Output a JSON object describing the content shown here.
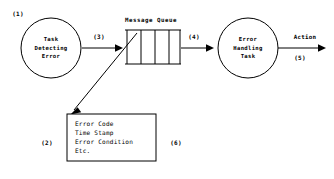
{
  "diagram": {
    "background_color": "#ffffff",
    "line_color": "#000000",
    "nodes": {
      "detecting_task": {
        "shape": "circle",
        "lines": [
          "Task",
          "Detecting",
          "Error"
        ],
        "line1": "Task",
        "line2": "Detecting",
        "line3": "Error"
      },
      "handling_task": {
        "shape": "circle",
        "lines": [
          "Error",
          "Handling",
          "Task"
        ],
        "line1": "Error",
        "line2": "Handling",
        "line3": "Task"
      },
      "message_queue": {
        "shape": "queue",
        "title": "Message Queue",
        "cell_count": 4
      },
      "message_content_box": {
        "shape": "rectangle",
        "lines": [
          "Error Code",
          "Time Stamp",
          "Error Condition",
          "Etc."
        ],
        "line1": "Error Code",
        "line2": "Time Stamp",
        "line3": "Error Condition",
        "line4": "Etc."
      }
    },
    "reference_labels": {
      "ref1": "(1)",
      "ref2": "(2)",
      "ref3": "(3)",
      "ref4": "(4)",
      "ref5": "(5)",
      "ref6": "(6)"
    },
    "edge_labels": {
      "action": "Action"
    }
  }
}
